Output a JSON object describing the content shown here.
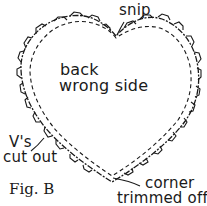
{
  "figure": {
    "caption": "Fig. B",
    "center_label": [
      "back",
      "wrong side"
    ],
    "callouts": {
      "snip": "snip",
      "vs_cut_out": [
        "V's",
        "cut out"
      ],
      "corner_trimmed": [
        "corner",
        "trimmed off"
      ]
    },
    "colors": {
      "ink": "#1a1a1a",
      "background": "#ffffff"
    }
  }
}
